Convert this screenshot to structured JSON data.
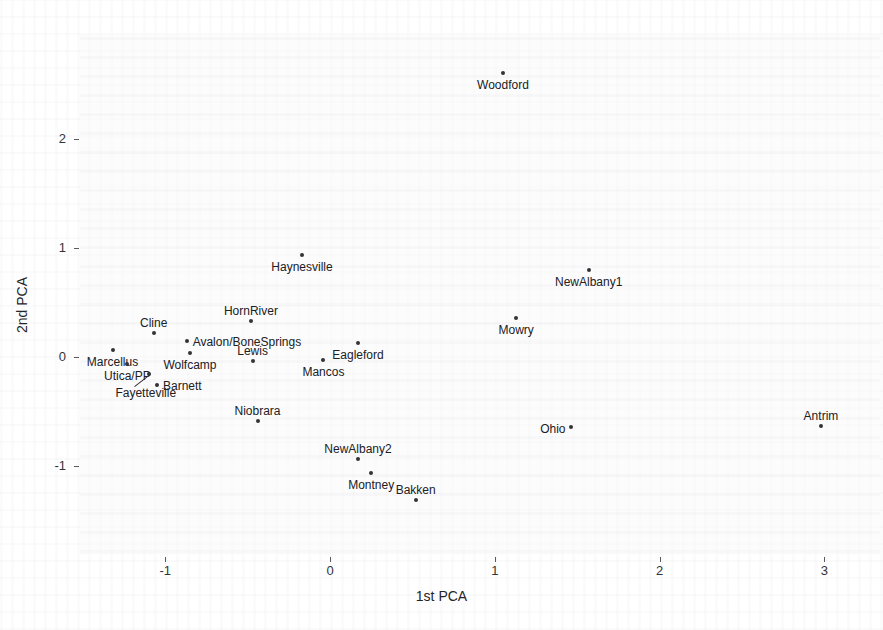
{
  "chart_data": {
    "type": "scatter",
    "title": "",
    "xlabel": "1st PCA",
    "ylabel": "2nd PCA",
    "xlim": [
      -1.55,
      3.35
    ],
    "ylim": [
      -1.45,
      2.85
    ],
    "xticks": [
      -1,
      0,
      1,
      2,
      3
    ],
    "xticklabels": [
      "-1",
      "0",
      "1",
      "2",
      "3"
    ],
    "yticks": [
      -1,
      0,
      1,
      2
    ],
    "yticklabels": [
      "-1",
      "0",
      "1",
      "2"
    ],
    "grid": false,
    "legend": null,
    "points": [
      {
        "label": "Woodford",
        "x": 1.05,
        "y": 2.61,
        "pos": "below-center"
      },
      {
        "label": "Haynesville",
        "x": -0.17,
        "y": 0.94,
        "pos": "below-center"
      },
      {
        "label": "NewAlbany1",
        "x": 1.57,
        "y": 0.8,
        "pos": "below-center"
      },
      {
        "label": "Mowry",
        "x": 1.13,
        "y": 0.36,
        "pos": "below-center"
      },
      {
        "label": "HornRiver",
        "x": -0.48,
        "y": 0.33,
        "pos": "above-center"
      },
      {
        "label": "Cline",
        "x": -1.07,
        "y": 0.22,
        "pos": "above-center"
      },
      {
        "label": "Avalon/BoneSprings",
        "x": -0.87,
        "y": 0.15,
        "pos": "right-mid"
      },
      {
        "label": "Eagleford",
        "x": 0.17,
        "y": 0.13,
        "pos": "below-center"
      },
      {
        "label": "Marcellus",
        "x": -1.32,
        "y": 0.06,
        "pos": "below-center"
      },
      {
        "label": "Wolfcamp",
        "x": -0.85,
        "y": 0.04,
        "pos": "below-center"
      },
      {
        "label": "Utica/PP",
        "x": -1.23,
        "y": -0.06,
        "pos": "below-center"
      },
      {
        "label": "Lewis",
        "x": -0.47,
        "y": -0.04,
        "pos": "above-center"
      },
      {
        "label": "Mancos",
        "x": -0.04,
        "y": -0.03,
        "pos": "below-center"
      },
      {
        "label": "Fayetteville",
        "x": -1.1,
        "y": -0.16,
        "pos": "leader-left"
      },
      {
        "label": "Barnett",
        "x": -1.05,
        "y": -0.26,
        "pos": "right-mid"
      },
      {
        "label": "Niobrara",
        "x": -0.44,
        "y": -0.59,
        "pos": "above-center"
      },
      {
        "label": "Ohio",
        "x": 1.46,
        "y": -0.64,
        "pos": "left-mid"
      },
      {
        "label": "Antrim",
        "x": 2.98,
        "y": -0.63,
        "pos": "above-center"
      },
      {
        "label": "NewAlbany2",
        "x": 0.17,
        "y": -0.94,
        "pos": "above-center"
      },
      {
        "label": "Montney",
        "x": 0.25,
        "y": -1.06,
        "pos": "below-center"
      },
      {
        "label": "Bakken",
        "x": 0.52,
        "y": -1.31,
        "pos": "above-center"
      }
    ],
    "marker_color": "#333337",
    "text_color": "#202024",
    "axis_color": "#5a5a5e",
    "background_color": "#ffffff"
  }
}
